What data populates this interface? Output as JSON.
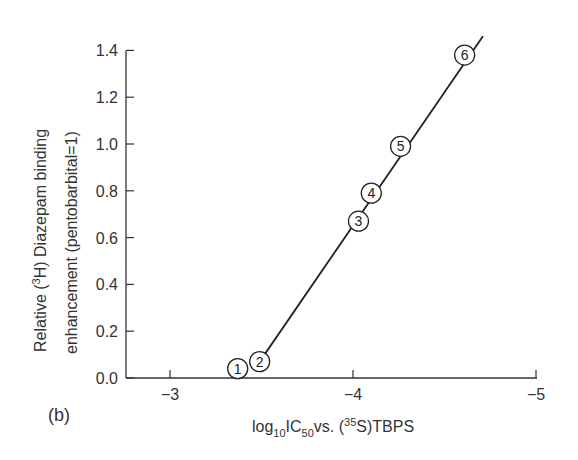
{
  "chart_data": {
    "type": "scatter",
    "panel_label": "(b)",
    "xlabel": {
      "prefix": "log",
      "sub1": "10",
      "mid": "IC",
      "sub2": "50",
      "after": "vs. (",
      "sup": "35",
      "suffix": "S)TBPS"
    },
    "ylabel": {
      "line1_prefix": "Relative (",
      "line1_sup": "3",
      "line1_suffix": "H) Diazepam binding",
      "line2": "enhancement  (pentobarbital=1)"
    },
    "xlim": [
      -2.8,
      -5.0
    ],
    "ylim": [
      0.0,
      1.4
    ],
    "x_ticks": [
      -3,
      -4,
      -5
    ],
    "x_tick_labels": [
      "−3",
      "−4",
      "−5"
    ],
    "y_ticks": [
      0.0,
      0.2,
      0.4,
      0.6,
      0.8,
      1.0,
      1.2,
      1.4
    ],
    "y_tick_labels": [
      "0.0",
      "0.2",
      "0.4",
      "0.6",
      "0.8",
      "1.0",
      "1.2",
      "1.4"
    ],
    "points": [
      {
        "label": "1",
        "x": -3.37,
        "y": 0.04
      },
      {
        "label": "2",
        "x": -3.49,
        "y": 0.07
      },
      {
        "label": "3",
        "x": -4.03,
        "y": 0.67
      },
      {
        "label": "4",
        "x": -4.1,
        "y": 0.79
      },
      {
        "label": "5",
        "x": -4.26,
        "y": 0.99
      },
      {
        "label": "6",
        "x": -4.61,
        "y": 1.38
      }
    ],
    "fit_line": {
      "x": [
        -3.49,
        -4.71
      ],
      "y": [
        0.07,
        1.46
      ]
    },
    "grid": false,
    "legend": null
  }
}
